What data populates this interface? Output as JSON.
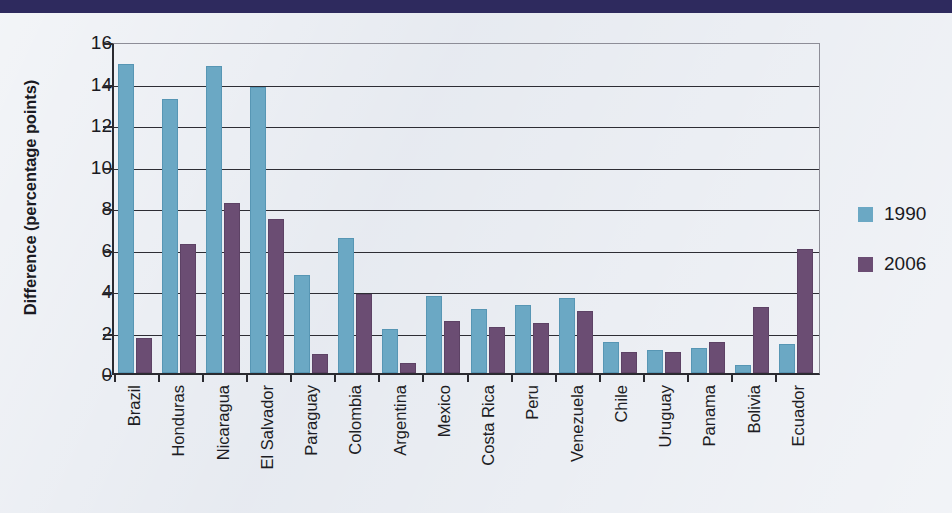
{
  "page": {
    "background_color": "#e4e8ef",
    "top_band_color": "#2e2a5e"
  },
  "chart_data": {
    "type": "bar",
    "title": "",
    "xlabel": "",
    "ylabel": "Difference (percentage points)",
    "ylim": [
      0,
      16
    ],
    "ytick_labels": [
      "16",
      "14",
      "12",
      "10",
      "8",
      "6",
      "4",
      "2",
      "0"
    ],
    "ytick_values": [
      16,
      14,
      12,
      10,
      8,
      6,
      4,
      2,
      0
    ],
    "grid": true,
    "legend_position": "right",
    "colors": {
      "1990": "#6ba8c4",
      "2006": "#6b4d73"
    },
    "categories": [
      "Brazil",
      "Honduras",
      "Nicaragua",
      "El Salvador",
      "Paraguay",
      "Colombia",
      "Argentina",
      "Mexico",
      "Costa Rica",
      "Peru",
      "Venezuela",
      "Chile",
      "Uruguay",
      "Panama",
      "Bolivia",
      "Ecuador"
    ],
    "series": [
      {
        "name": "1990",
        "color": "#6ba8c4",
        "values": [
          14.9,
          13.2,
          14.8,
          13.8,
          4.7,
          6.5,
          2.1,
          3.7,
          3.1,
          3.3,
          3.6,
          1.5,
          1.1,
          1.2,
          0.4,
          1.4
        ]
      },
      {
        "name": "2006",
        "color": "#6b4d73",
        "values": [
          1.7,
          6.2,
          8.2,
          7.4,
          0.9,
          3.8,
          0.5,
          2.5,
          2.2,
          2.4,
          3.0,
          1.0,
          1.0,
          1.5,
          3.2,
          6.0
        ]
      }
    ]
  },
  "legend": {
    "entries": [
      {
        "label": "1990"
      },
      {
        "label": "2006"
      }
    ]
  }
}
